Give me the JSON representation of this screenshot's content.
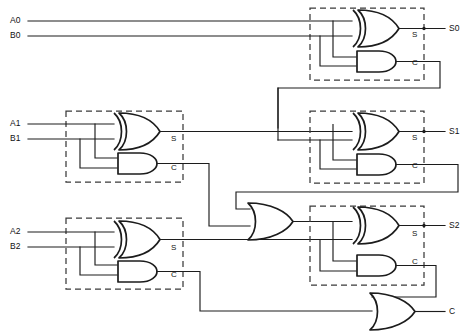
{
  "diagram": {
    "type": "logic-circuit-schematic",
    "canvas": {
      "width": 476,
      "height": 333
    },
    "colors": {
      "background": "#ffffff",
      "wire": "#1c1c1c",
      "gate_outline": "#1c1c1c",
      "dashed_block": "#3a3a3a",
      "text": "#111111"
    }
  },
  "inputs": [
    {
      "name": "input-a0",
      "label": "A0",
      "x": 10,
      "y": 18
    },
    {
      "name": "input-b0",
      "label": "B0",
      "x": 10,
      "y": 33
    },
    {
      "name": "input-a1",
      "label": "A1",
      "x": 10,
      "y": 118
    },
    {
      "name": "input-b1",
      "label": "B1",
      "x": 10,
      "y": 133
    },
    {
      "name": "input-a2",
      "label": "A2",
      "x": 10,
      "y": 226
    },
    {
      "name": "input-b2",
      "label": "B2",
      "x": 10,
      "y": 241
    }
  ],
  "outputs": [
    {
      "name": "output-s0",
      "label": "S0",
      "x": 449,
      "y": 22
    },
    {
      "name": "output-s1",
      "label": "S1",
      "x": 449,
      "y": 125
    },
    {
      "name": "output-s2",
      "label": "S2",
      "x": 449,
      "y": 229
    },
    {
      "name": "output-carry",
      "label": "C",
      "x": 449,
      "y": 307
    }
  ],
  "blocks": [
    {
      "name": "half-adder-top-right",
      "pin_sum": "S",
      "pin_carry": "C",
      "sum_label_x": 412,
      "sum_label_y": 30,
      "carry_label_x": 412,
      "carry_label_y": 58
    },
    {
      "name": "half-adder-middle-left",
      "pin_sum": "S",
      "pin_carry": "C",
      "sum_label_x": 171,
      "sum_label_y": 134,
      "carry_label_x": 171,
      "carry_label_y": 163
    },
    {
      "name": "half-adder-middle-right",
      "pin_sum": "S",
      "pin_carry": "C",
      "sum_label_x": 412,
      "sum_label_y": 133,
      "carry_label_x": 412,
      "carry_label_y": 161
    },
    {
      "name": "half-adder-bottom-left",
      "pin_sum": "S",
      "pin_carry": "C",
      "sum_label_x": 171,
      "sum_label_y": 243,
      "carry_label_x": 171,
      "carry_label_y": 270
    },
    {
      "name": "half-adder-bottom-right",
      "pin_sum": "S",
      "pin_carry": "C",
      "sum_label_x": 412,
      "sum_label_y": 236,
      "carry_label_x": 412,
      "carry_label_y": 264
    }
  ],
  "gates": [
    {
      "name": "xor-gate-ha0",
      "type": "XOR"
    },
    {
      "name": "and-gate-ha0",
      "type": "AND"
    },
    {
      "name": "xor-gate-ha1",
      "type": "XOR"
    },
    {
      "name": "and-gate-ha1",
      "type": "AND"
    },
    {
      "name": "xor-gate-ha2",
      "type": "XOR"
    },
    {
      "name": "and-gate-ha2",
      "type": "AND"
    },
    {
      "name": "xor-gate-ha3",
      "type": "XOR"
    },
    {
      "name": "and-gate-ha3",
      "type": "AND"
    },
    {
      "name": "xor-gate-ha4",
      "type": "XOR"
    },
    {
      "name": "and-gate-ha4",
      "type": "AND"
    },
    {
      "name": "or-gate-carry-mid",
      "type": "OR"
    },
    {
      "name": "or-gate-carry-out",
      "type": "OR"
    }
  ]
}
